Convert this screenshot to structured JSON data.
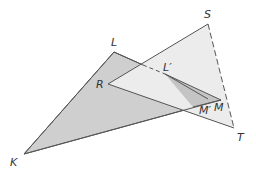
{
  "diagram": {
    "colors": {
      "background": "#ffffff",
      "triangle_klm_fill": "#cfcfcf",
      "triangle_rst_fill": "#ececec",
      "inner_triangle_fill": "#c4c4c4",
      "stroke": "#555555"
    },
    "points": {
      "K": {
        "label": "K",
        "x": 24,
        "y": 154
      },
      "L": {
        "label": "L",
        "x": 114,
        "y": 52
      },
      "M": {
        "label": "M",
        "x": 221,
        "y": 100
      },
      "R": {
        "label": "R",
        "x": 108,
        "y": 84
      },
      "S": {
        "label": "S",
        "x": 208,
        "y": 24
      },
      "T": {
        "label": "T",
        "x": 234,
        "y": 128
      },
      "Lp": {
        "label": "L′",
        "x": 165,
        "y": 74
      },
      "Mp": {
        "label": "M′",
        "x": 193,
        "y": 107
      }
    },
    "labels": {
      "K": "K",
      "L": "L",
      "M": "M",
      "R": "R",
      "S": "S",
      "T": "T",
      "Lp": "L′",
      "Mp": "M′"
    }
  }
}
